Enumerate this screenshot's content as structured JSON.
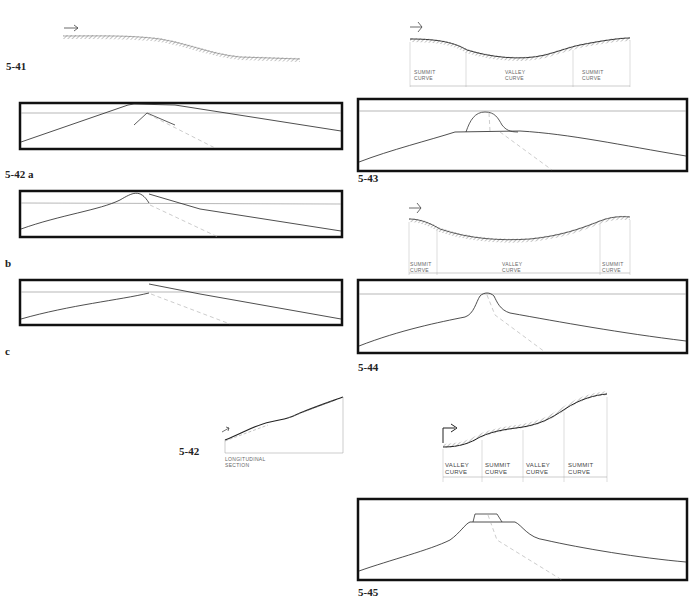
{
  "figures": {
    "f541": {
      "label": "5-41"
    },
    "f542a": {
      "label": "5-42 a"
    },
    "f542b": {
      "label": "b"
    },
    "f542c": {
      "label": "c"
    },
    "f542": {
      "label": "5-42",
      "caption_line1": "LONGITUDINAL",
      "caption_line2": "SECTION"
    },
    "f543": {
      "label": "5-43",
      "segments": [
        "SUMMIT",
        "CURVE",
        "VALLEY",
        "CURVE",
        "SUMMIT",
        "CURVE"
      ]
    },
    "f544": {
      "label": "5-44",
      "segments": [
        "SUMMIT",
        "CURVE",
        "VALLEY",
        "CURVE",
        "SUMMIT",
        "CURVE"
      ]
    },
    "f545": {
      "label": "5-45",
      "segments": [
        "VALLEY",
        "CURVE",
        "SUMMIT",
        "CURVE",
        "VALLEY",
        "CURVE",
        "SUMMIT",
        "CURVE"
      ]
    }
  },
  "colors": {
    "ink": "#1a1a1a",
    "frame": "#111111",
    "hatch": "#8a8a8a",
    "dashed": "#9a9a9a"
  }
}
